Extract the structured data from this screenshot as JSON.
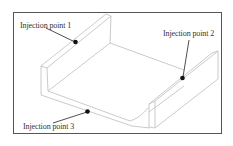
{
  "diagram": {
    "type": "isometric part drawing",
    "part": "U-shaped channel (two side walls and floor)",
    "colors": {
      "frame": "#555555",
      "part_edges": "#bdbdbd",
      "leader": "#222222",
      "marker": "#111111",
      "label_text": "#333333"
    },
    "labels": [
      {
        "id": "injection-point-1",
        "text": "Injection point 1"
      },
      {
        "id": "injection-point-2",
        "text": "Injection point 2"
      },
      {
        "id": "injection-point-3",
        "text": "Injection point 3"
      }
    ]
  }
}
